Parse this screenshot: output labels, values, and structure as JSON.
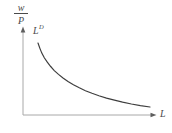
{
  "figure": {
    "background": "#ffffff",
    "text_color": "#4a4a4a",
    "axes": {
      "color": "#a8a8a8",
      "arrow_color": "#5f5f5f",
      "y_axis_label": {
        "numerator": "w",
        "denominator": "P"
      },
      "x_axis_label": "L"
    },
    "curve": {
      "label_base": "L",
      "label_superscript": "D",
      "color": "#3e3e3e"
    }
  },
  "chart_data": {
    "type": "line",
    "title": "",
    "xlabel": "L",
    "ylabel": "w/P",
    "x_range": [
      0,
      1
    ],
    "y_range": [
      0,
      1
    ],
    "grid": false,
    "ticks": "none (qualitative diagram, unlabeled axes with arrowheads)",
    "legend": "inline label L^D at upper end of curve",
    "series": [
      {
        "name": "L^D",
        "shape": "convex decreasing (hyperbola-like labor demand curve)",
        "x": [
          0.113,
          0.126,
          0.141,
          0.16,
          0.183,
          0.208,
          0.235,
          0.267,
          0.301,
          0.338,
          0.379,
          0.423,
          0.469,
          0.519,
          0.571,
          0.628,
          0.687,
          0.749,
          0.815,
          0.883,
          0.955
        ],
        "y": [
          0.818,
          0.76,
          0.703,
          0.65,
          0.6,
          0.551,
          0.505,
          0.461,
          0.42,
          0.381,
          0.343,
          0.309,
          0.276,
          0.247,
          0.218,
          0.192,
          0.168,
          0.145,
          0.125,
          0.107,
          0.091
        ]
      }
    ]
  }
}
